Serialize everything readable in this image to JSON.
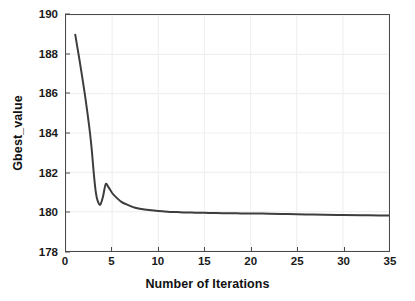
{
  "chart_data": {
    "type": "line",
    "title": "",
    "xlabel": "Number of Iterations",
    "ylabel": "Gbest_value",
    "xlim": [
      0,
      35
    ],
    "ylim": [
      178,
      190
    ],
    "xticks": [
      0,
      5,
      10,
      15,
      20,
      25,
      30,
      35
    ],
    "yticks": [
      178,
      180,
      182,
      184,
      186,
      188,
      190
    ],
    "grid": true,
    "legend": null,
    "line_color": "#3d3d3d",
    "line_width": 2.0,
    "series": [
      {
        "name": "Gbest_value",
        "x": [
          1,
          1.5,
          2,
          2.3,
          2.6,
          2.8,
          3.0,
          3.2,
          3.4,
          3.7,
          4.0,
          4.3,
          4.6,
          5.0,
          5.5,
          6.0,
          6.5,
          7.0,
          7.5,
          8.0,
          9.0,
          10.0,
          11.0,
          12.0,
          13.0,
          14.0,
          15.0,
          16.0,
          17.0,
          18.0,
          19.0,
          20.0,
          22.0,
          24.0,
          26.0,
          28.0,
          30.0,
          32.0,
          34.0,
          35.0
        ],
        "y": [
          189.0,
          187.6,
          186.1,
          185.1,
          184.0,
          183.1,
          182.0,
          181.1,
          180.6,
          180.35,
          180.75,
          181.4,
          181.25,
          180.95,
          180.7,
          180.5,
          180.38,
          180.28,
          180.2,
          180.15,
          180.08,
          180.03,
          180.0,
          179.98,
          179.96,
          179.95,
          179.94,
          179.93,
          179.92,
          179.92,
          179.91,
          179.91,
          179.9,
          179.88,
          179.86,
          179.84,
          179.83,
          179.82,
          179.81,
          179.8
        ]
      }
    ]
  },
  "axes": {
    "y_tick_labels": [
      "190",
      "188",
      "186",
      "184",
      "182",
      "180",
      "178"
    ],
    "x_tick_labels": [
      "0",
      "5",
      "10",
      "15",
      "20",
      "25",
      "30",
      "35"
    ],
    "x_axis_title": "Number of Iterations",
    "y_axis_title": "Gbest_value"
  },
  "colors": {
    "line": "#3d3d3d",
    "axis": "#4a4a4a",
    "grid": "#f0f0f0",
    "background": "#ffffff",
    "text": "#1a1a1a"
  }
}
